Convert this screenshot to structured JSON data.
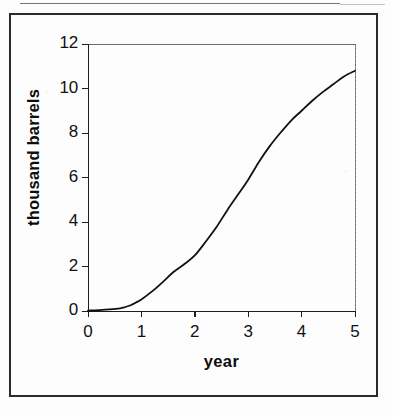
{
  "page": {
    "background_color": "#fdfdfe",
    "ink_color": "#1d1d1d",
    "frame_color": "#2b2b2b"
  },
  "chart_data": {
    "type": "line",
    "title": "",
    "subtitle": "",
    "xlabel": "year",
    "ylabel": "thousand barrels",
    "xlim": [
      0,
      5
    ],
    "ylim": [
      0,
      12
    ],
    "xticks": [
      0,
      1,
      2,
      3,
      4,
      5
    ],
    "yticks": [
      0,
      2,
      4,
      6,
      8,
      10,
      12
    ],
    "xtick_labels": [
      "0",
      "1",
      "2",
      "3",
      "4",
      "5"
    ],
    "ytick_labels": [
      "0",
      "2",
      "4",
      "6",
      "8",
      "10",
      "12"
    ],
    "grid": false,
    "legend": null,
    "legend_position": "none",
    "annotations": [],
    "series": [
      {
        "name": "cumulative production",
        "line_color": "#111111",
        "line_width": 1.8,
        "markers": false,
        "x": [
          0,
          0.2,
          0.4,
          0.6,
          0.7,
          0.8,
          0.9,
          1.0,
          1.2,
          1.4,
          1.6,
          1.8,
          2.0,
          2.2,
          2.4,
          2.6,
          2.8,
          3.0,
          3.2,
          3.4,
          3.6,
          3.8,
          4.0,
          4.2,
          4.4,
          4.6,
          4.8,
          5.0
        ],
        "y": [
          0.02,
          0.04,
          0.07,
          0.12,
          0.18,
          0.26,
          0.38,
          0.52,
          0.88,
          1.3,
          1.75,
          2.1,
          2.5,
          3.1,
          3.75,
          4.5,
          5.2,
          5.9,
          6.7,
          7.4,
          8.0,
          8.55,
          9.0,
          9.45,
          9.85,
          10.2,
          10.55,
          10.8
        ]
      }
    ]
  }
}
